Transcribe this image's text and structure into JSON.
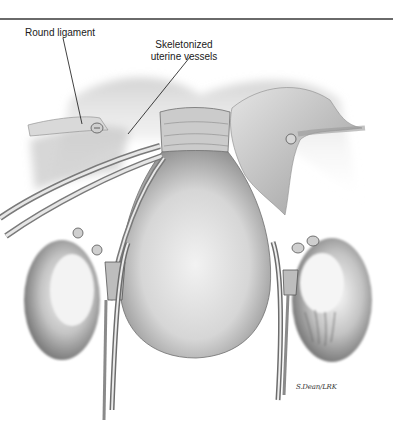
{
  "figure": {
    "type": "surgical-illustration",
    "labels": {
      "round_ligament": "Round ligament",
      "skeletonized_line1": "Skeletonized",
      "skeletonized_line2": "uterine vessels"
    },
    "signature": "S.Dean/LRK",
    "colors": {
      "rule": "#6a6a6a",
      "label_text": "#1a1a1a",
      "tissue_light": "#e9e9e9",
      "tissue_mid": "#b8b8b8",
      "tissue_dark": "#5e5e5e",
      "instrument": "#8a8a8a"
    }
  }
}
